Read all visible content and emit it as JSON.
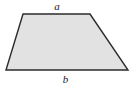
{
  "figure": {
    "name": "trapezoid",
    "type": "geometry-diagram",
    "background_color": "#ffffff",
    "shape": {
      "kind": "trapezoid",
      "fill_color": "#e2e2e2",
      "stroke_color": "#2b2b2b",
      "stroke_width": 1.4,
      "vertices": [
        {
          "name": "top-left",
          "x": 23,
          "y": 14
        },
        {
          "name": "top-right",
          "x": 90,
          "y": 14
        },
        {
          "name": "bottom-right",
          "x": 128,
          "y": 70
        },
        {
          "name": "bottom-left",
          "x": 6,
          "y": 70
        }
      ],
      "points_attr": "23,14 90,14 128,70 6,70"
    },
    "labels": {
      "top": {
        "text": "a",
        "describes": "top-side",
        "position": "above-top-edge"
      },
      "bottom": {
        "text": "b",
        "describes": "bottom-side",
        "position": "below-bottom-edge"
      }
    }
  }
}
